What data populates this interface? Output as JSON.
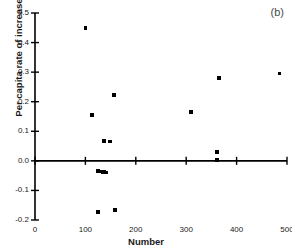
{
  "panel": {
    "label": "(b)"
  },
  "chart_data": {
    "type": "scatter",
    "title": "",
    "subtitle": "",
    "xlabel": "Number",
    "ylabel": "Per capita rate of increase",
    "xlim": [
      0,
      500
    ],
    "ylim": [
      -0.2,
      0.5
    ],
    "xticks": [
      0,
      100,
      200,
      300,
      400,
      500
    ],
    "xtick_labels": [
      "0",
      "100",
      "200",
      "300",
      "400",
      "500"
    ],
    "yticks": [
      -0.2,
      -0.1,
      0.0,
      0.1,
      0.2,
      0.3,
      0.4,
      0.5
    ],
    "ytick_labels": [
      "-0.2",
      "-0.1",
      "0.0",
      "0.1",
      "0.2",
      "0.3",
      "0.4",
      "0.5"
    ],
    "grid": false,
    "legend": null,
    "marker": "square",
    "marker_color": "#000000",
    "zero_line": 0.0,
    "points": [
      {
        "x": 100,
        "y": 0.45
      },
      {
        "x": 113,
        "y": 0.155
      },
      {
        "x": 157,
        "y": 0.222
      },
      {
        "x": 137,
        "y": 0.068
      },
      {
        "x": 149,
        "y": 0.065
      },
      {
        "x": 125,
        "y": -0.034
      },
      {
        "x": 130,
        "y": -0.036
      },
      {
        "x": 134,
        "y": -0.037
      },
      {
        "x": 138,
        "y": -0.038
      },
      {
        "x": 142,
        "y": -0.039
      },
      {
        "x": 125,
        "y": -0.172
      },
      {
        "x": 159,
        "y": -0.166
      },
      {
        "x": 310,
        "y": 0.165
      },
      {
        "x": 361,
        "y": 0.03
      },
      {
        "x": 361,
        "y": 0.002
      },
      {
        "x": 365,
        "y": 0.28
      },
      {
        "x": 485,
        "y": 0.295
      }
    ]
  }
}
